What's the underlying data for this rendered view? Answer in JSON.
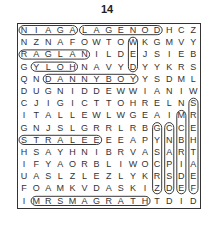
{
  "puzzle": {
    "number": "14",
    "rows": [
      "NIAGALAGENODHCZ",
      "NZNAFOWTOWKGMVY",
      "RAGLANILDEJSIEB",
      "GYLOHNAVYDYYKRS",
      "QNDANNYBOYYSDML",
      "DUGNIDDEWWIANIW",
      "CJIGICTTOHRELNS",
      "ITALLEWLWGEAIMR",
      "GNJSLGRRLRBGCCE",
      "STRALEEEEAPYNBH",
      "HSAYHNIBRVASART",
      "IFYAORBLIWOCPIA",
      "UASLZLEZLYKRSDE",
      "FOAMKVDASKIZDEF",
      "IMRSMAGRATHTDID"
    ],
    "found_words_horizontal": [
      {
        "word": "NIAGA",
        "row": 0,
        "start": 0,
        "end": 4
      },
      {
        "word": "LAGENOD",
        "row": 0,
        "start": 5,
        "end": 11
      },
      {
        "word": "RAGLAN",
        "row": 2,
        "start": 0,
        "end": 5
      },
      {
        "word": "YLOH",
        "row": 3,
        "start": 1,
        "end": 4
      },
      {
        "word": "DANNYBOY",
        "row": 4,
        "start": 2,
        "end": 9
      },
      {
        "word": "STRALEE",
        "row": 9,
        "start": 0,
        "end": 6
      },
      {
        "word": "MRSMAGRATH",
        "row": 14,
        "start": 1,
        "end": 10
      }
    ],
    "found_words_vertical": [
      {
        "col": 9,
        "start": 1,
        "end": 3
      },
      {
        "col": 14,
        "start": 6,
        "end": 13
      },
      {
        "col": 13,
        "start": 7,
        "end": 13
      },
      {
        "col": 12,
        "start": 8,
        "end": 13
      },
      {
        "col": 11,
        "start": 8,
        "end": 13
      }
    ]
  }
}
